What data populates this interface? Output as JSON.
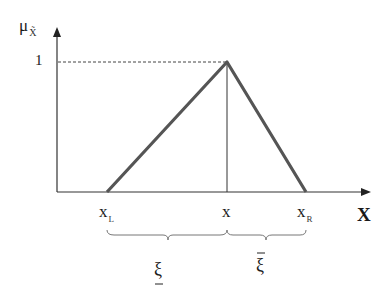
{
  "diagram": {
    "type": "triangular-fuzzy-number",
    "y_axis": {
      "label": "μ",
      "label_sub": "X̃",
      "tick_label": "1"
    },
    "x_axis": {
      "label": "X"
    },
    "points": [
      {
        "label": "x",
        "sub": "L"
      },
      {
        "label": "x",
        "sub": ""
      },
      {
        "label": "x",
        "sub": "R"
      }
    ],
    "spreads": [
      {
        "symbol": "ξ",
        "decoration": "underline"
      },
      {
        "symbol": "ξ",
        "decoration": "overline"
      }
    ],
    "colors": {
      "membership_line": "#555555",
      "axis": "#333333",
      "dashed": "#444444",
      "brace": "#777777"
    }
  }
}
